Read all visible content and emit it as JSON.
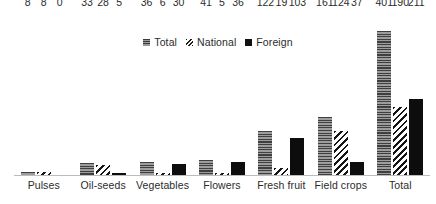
{
  "legend": {
    "items": [
      {
        "label": "Total",
        "swatch": "total-hatch-swatch"
      },
      {
        "label": "National",
        "swatch": "national-diagonal-swatch"
      },
      {
        "label": "Foreign",
        "swatch": "foreign-solid-swatch"
      }
    ]
  },
  "chart_data": {
    "type": "bar",
    "title": "",
    "subtitle": "",
    "xlabel": "",
    "ylabel": "",
    "ylim": [
      0,
      430
    ],
    "grid": false,
    "legend_position": "top-center",
    "axis": {
      "y_visible": false,
      "x_visible": true
    },
    "data_labels": true,
    "categories": [
      "Pulses",
      "Oil-seeds",
      "Vegetables",
      "Flowers",
      "Fresh fruit",
      "Field crops",
      "Total"
    ],
    "series": [
      {
        "name": "Total",
        "values": [
          8,
          33,
          36,
          41,
          122,
          161,
          401
        ]
      },
      {
        "name": "National",
        "values": [
          8,
          28,
          6,
          5,
          19,
          124,
          190
        ]
      },
      {
        "name": "Foreign",
        "values": [
          0,
          5,
          30,
          36,
          103,
          37,
          211
        ]
      }
    ]
  }
}
